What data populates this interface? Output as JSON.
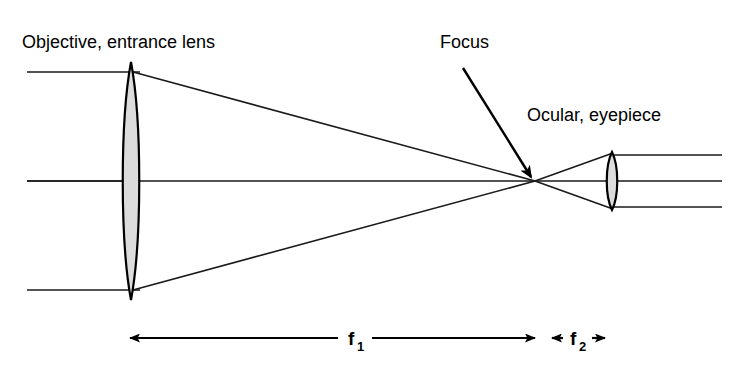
{
  "figure": {
    "background_color": "#ffffff",
    "ink_color": "#000000",
    "lens_fill_color": "#dcdcdc",
    "width": 733,
    "height": 367
  },
  "labels": {
    "objective": "Objective, entrance lens",
    "focus": "Focus",
    "ocular": "Ocular, eyepiece",
    "f1": "f",
    "f1_sub": "1",
    "f2": "f",
    "f2_sub": "2"
  },
  "geometry": {
    "optical_axis_y": 181,
    "objective_lens": {
      "x": 131,
      "top_y": 62,
      "bottom_y": 300,
      "half_width": 11
    },
    "ocular_lens": {
      "x": 612,
      "top_y": 152,
      "bottom_y": 210,
      "half_width": 7
    },
    "focus_point": {
      "x": 535,
      "y": 181
    },
    "incoming_ray_y": [
      72,
      181,
      290
    ],
    "incoming_ray_start_x": 27,
    "outgoing_ray_y": [
      155,
      181,
      207
    ],
    "outgoing_ray_end_x": 722,
    "focus_pointer": {
      "x1": 463,
      "y1": 68,
      "x2": 531,
      "y2": 177
    }
  },
  "dimensions": {
    "baseline_y": 338,
    "f1": {
      "left_x": 130,
      "right_x": 535,
      "label_x": 355,
      "gap_left": 338,
      "gap_right": 372
    },
    "f2": {
      "left_x": 540,
      "right_x": 614,
      "label_x": 578,
      "gap_left": 563,
      "gap_right": 592
    }
  },
  "annotations": {
    "objective_label_pos": {
      "x": 22,
      "y": 48
    },
    "focus_label_pos": {
      "x": 440,
      "y": 48
    },
    "ocular_label_pos": {
      "x": 527,
      "y": 121
    }
  }
}
